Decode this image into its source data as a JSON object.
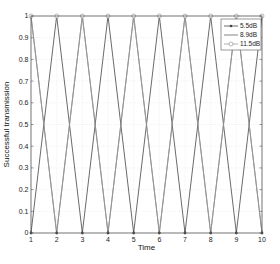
{
  "chart_data": {
    "type": "line",
    "title": "",
    "xlabel": "Time",
    "ylabel": "Successful transmission",
    "x": [
      1,
      2,
      3,
      4,
      5,
      6,
      7,
      8,
      9,
      10
    ],
    "xlim": [
      1,
      10
    ],
    "ylim": [
      0,
      1
    ],
    "xticks": [
      "1",
      "2",
      "3",
      "4",
      "5",
      "6",
      "7",
      "8",
      "9",
      "10"
    ],
    "yticks": [
      "0",
      "0.1",
      "0.2",
      "0.3",
      "0.4",
      "0.5",
      "0.6",
      "0.7",
      "0.8",
      "0.9",
      "1"
    ],
    "grid": true,
    "legend_position": "upper right",
    "series": [
      {
        "name": "5.5dB",
        "marker": "dot",
        "color": "#444444",
        "values": [
          0,
          1,
          0,
          1,
          0,
          1,
          0,
          1,
          0,
          1
        ]
      },
      {
        "name": "8.9dB",
        "marker": "none",
        "color": "#666666",
        "values": [
          1,
          0,
          1,
          0,
          1,
          0,
          1,
          0,
          1,
          0
        ]
      },
      {
        "name": "11.5dB",
        "marker": "circle",
        "color": "#999999",
        "values": [
          1,
          0,
          1,
          0,
          1,
          0,
          1,
          0,
          1,
          0
        ]
      }
    ],
    "marker_rows": {
      "top_circles": [
        1,
        2,
        3,
        4,
        5,
        6,
        7,
        8,
        9,
        10
      ],
      "bottom_dots": [
        1,
        2,
        3,
        4,
        5,
        6,
        7,
        8,
        9,
        10
      ]
    }
  }
}
